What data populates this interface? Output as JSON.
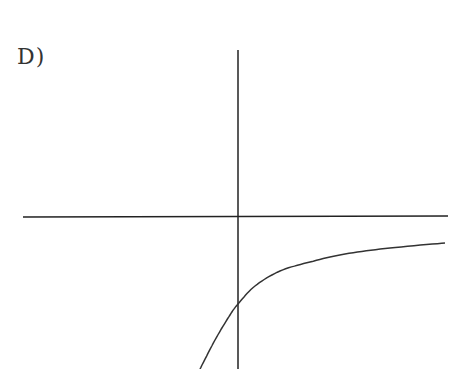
{
  "figure": {
    "label": "D)"
  },
  "chart_data": {
    "type": "line",
    "title": "D)",
    "xlabel": "",
    "ylabel": "",
    "grid": false,
    "legend": null,
    "axes": {
      "x_axis_y_px": 217,
      "y_axis_x_px": 238
    },
    "series": [
      {
        "name": "curve",
        "description": "Increasing concave-down curve, negative everywhere shown; crosses y-axis below origin and levels off approaching horizontal asymptote below x-axis",
        "points_px": [
          [
            200,
            369
          ],
          [
            215,
            340
          ],
          [
            230,
            315
          ],
          [
            238,
            304
          ],
          [
            255,
            286
          ],
          [
            280,
            271
          ],
          [
            310,
            262
          ],
          [
            345,
            254
          ],
          [
            390,
            248
          ],
          [
            445,
            243
          ]
        ]
      }
    ],
    "colors": {
      "axis": "#222222",
      "curve": "#333333"
    }
  }
}
